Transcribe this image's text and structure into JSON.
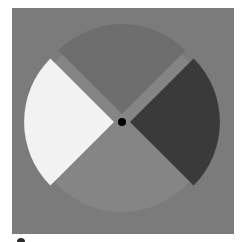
{
  "figure": {
    "canvas": {
      "x": 12,
      "y": 8,
      "width": 222,
      "height": 226
    },
    "center": {
      "x": 122,
      "y": 122
    },
    "radius": 90,
    "wedge_offset": 8,
    "colors": {
      "background": "#7b7b7b",
      "base_circle": "#858585",
      "top_wedge": "#6e6e6e",
      "left_wedge": "#f2f2f2",
      "right_wedge": "#3a3a3a",
      "bottom_wedge": "#858585",
      "fixation_dot": "#000000"
    },
    "wedges": [
      {
        "name": "top",
        "shade": "medium-dark gray"
      },
      {
        "name": "left",
        "shade": "white"
      },
      {
        "name": "right",
        "shade": "dark gray"
      },
      {
        "name": "bottom",
        "shade": "light-medium gray"
      }
    ],
    "fixation_dot": {
      "radius": 4
    }
  }
}
